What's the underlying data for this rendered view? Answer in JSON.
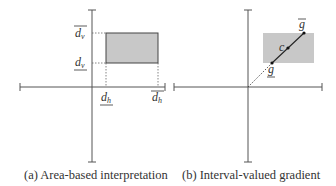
{
  "figure": {
    "panels": [
      {
        "id": "a",
        "caption": "(a) Area-based interpretation",
        "labels": {
          "dv_upper": "d",
          "dv_upper_sub": "v",
          "dv_lower": "d",
          "dv_lower_sub": "v",
          "dh_lower": "d",
          "dh_lower_sub": "h",
          "dh_upper": "d",
          "dh_upper_sub": "h"
        }
      },
      {
        "id": "b",
        "caption": "(b) Interval-valued gradient",
        "labels": {
          "g_upper": "g",
          "g_lower": "g",
          "center": "c"
        }
      }
    ],
    "colors": {
      "axis": "#555555",
      "rect_fill": "#c8c8c8",
      "rect_stroke": "#444444",
      "line": "#222222"
    }
  }
}
